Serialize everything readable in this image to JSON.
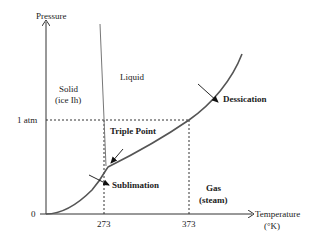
{
  "diagram": {
    "axes": {
      "y_label": "Pressure",
      "x_label_line1": "Temperature",
      "x_label_line2": "(°K)",
      "y_ticks": [
        {
          "label": "1 atm"
        },
        {
          "label": "0"
        }
      ],
      "x_ticks": [
        {
          "label": "273"
        },
        {
          "label": "373"
        }
      ]
    },
    "regions": {
      "solid_line1": "Solid",
      "solid_line2": "(ice Ih)",
      "liquid": "Liquid",
      "gas_line1": "Gas",
      "gas_line2": "(steam)"
    },
    "annotations": {
      "triple_point": "Triple Point",
      "sublimation": "Sublimation",
      "dessication": "Dessication"
    },
    "colors": {
      "curve": "#555555",
      "axis": "#333333",
      "dashed": "#333333",
      "text": "#222222"
    }
  }
}
